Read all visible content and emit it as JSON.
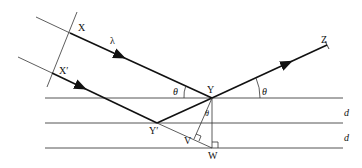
{
  "diagram": {
    "type": "bragg-diffraction",
    "labels": {
      "X": "X",
      "X_prime": "X′",
      "Y": "Y",
      "Y_prime": "Y′",
      "Z": "Z",
      "V": "V",
      "W": "W",
      "lambda": "λ",
      "theta_left": "θ",
      "theta_right": "θ",
      "theta_inner": "θ",
      "d1": "d",
      "d2": "d"
    },
    "colors": {
      "line": "#111111",
      "plane": "#555555"
    }
  }
}
